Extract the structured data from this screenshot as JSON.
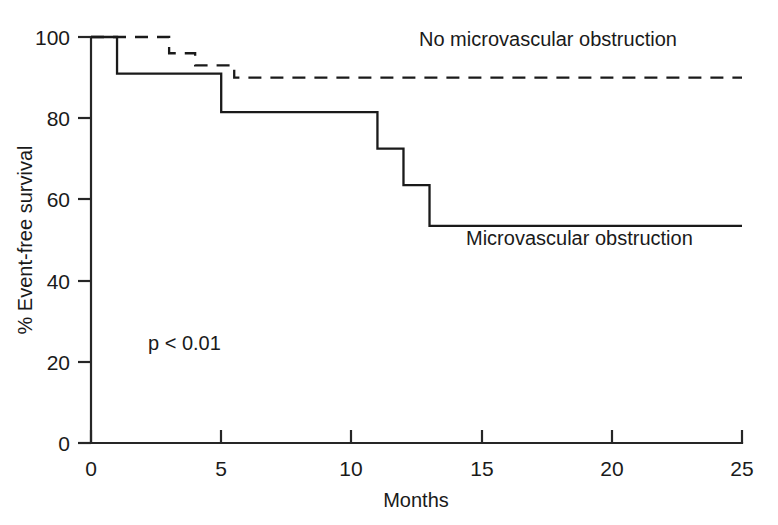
{
  "chart_data": {
    "type": "line",
    "subtype": "kaplan-meier-step",
    "title": "",
    "xlabel": "Months",
    "ylabel": "% Event-free survival",
    "xlim": [
      0,
      25
    ],
    "ylim": [
      0,
      100
    ],
    "xticks": [
      0,
      5,
      10,
      15,
      20,
      25
    ],
    "yticks": [
      0,
      20,
      40,
      60,
      80,
      100
    ],
    "xtick_labels": [
      "0",
      "5",
      "10",
      "15",
      "20",
      "25"
    ],
    "ytick_labels": [
      "0",
      "20",
      "40",
      "60",
      "80",
      "100"
    ],
    "grid": false,
    "legend_position": "inline-annotation",
    "annotations": [
      {
        "name": "p-value",
        "text": "p < 0.01",
        "x": 3.5,
        "y": 28
      }
    ],
    "series": [
      {
        "name": "No microvascular obstruction",
        "style": "dashed",
        "color": "#1a1a1a",
        "label_x": 12.6,
        "label_y": 94,
        "x": [
          0,
          3.0,
          3.0,
          4.0,
          4.0,
          5.5,
          5.5,
          25
        ],
        "y": [
          100,
          100,
          96,
          96,
          93,
          93,
          90,
          90
        ],
        "steps": [
          {
            "time": 0,
            "survival": 100
          },
          {
            "time": 3.0,
            "survival": 96
          },
          {
            "time": 4.0,
            "survival": 93
          },
          {
            "time": 5.5,
            "survival": 90
          },
          {
            "time": 25,
            "survival": 90
          }
        ]
      },
      {
        "name": "Microvascular obstruction",
        "style": "solid",
        "color": "#1a1a1a",
        "label_x": 14.0,
        "label_y": 48,
        "x": [
          0,
          1.0,
          1.0,
          5.0,
          5.0,
          11.0,
          11.0,
          12.0,
          12.0,
          13.0,
          13.0,
          25
        ],
        "y": [
          100,
          100,
          91,
          91,
          81.5,
          81.5,
          72.5,
          72.5,
          63.5,
          63.5,
          53.5,
          53.5
        ],
        "steps": [
          {
            "time": 0,
            "survival": 100
          },
          {
            "time": 1.0,
            "survival": 91
          },
          {
            "time": 5.0,
            "survival": 81.5
          },
          {
            "time": 11.0,
            "survival": 72.5
          },
          {
            "time": 12.0,
            "survival": 63.5
          },
          {
            "time": 13.0,
            "survival": 53.5
          },
          {
            "time": 25,
            "survival": 53.5
          }
        ]
      }
    ]
  },
  "figure": {
    "background": "#ffffff",
    "ink_color": "#1a1a1a"
  }
}
